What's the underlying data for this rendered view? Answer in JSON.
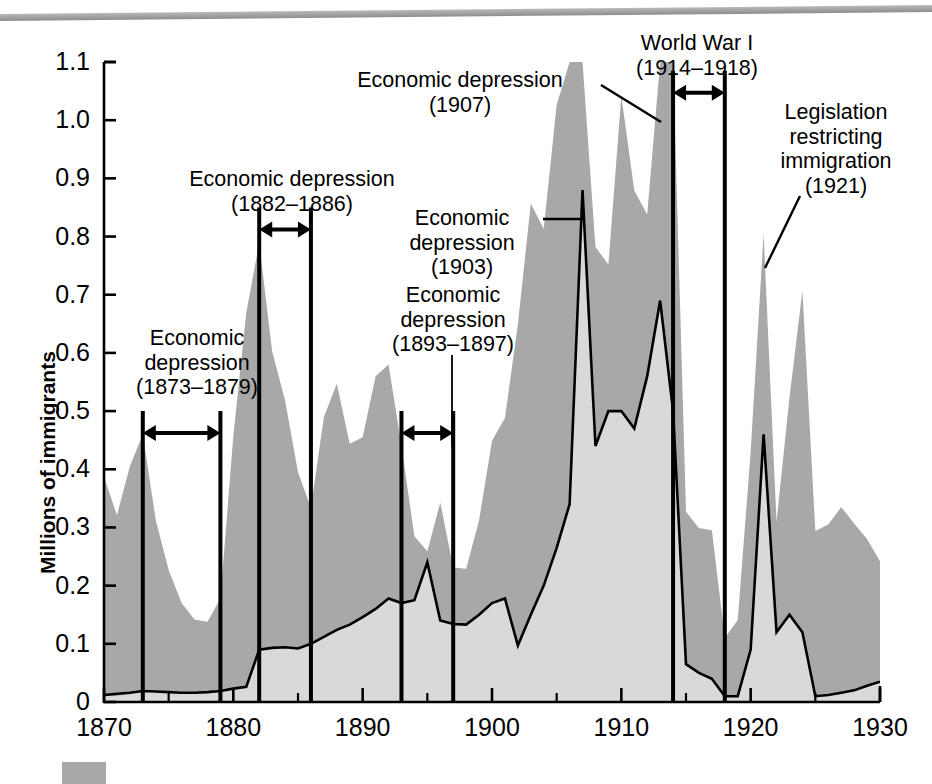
{
  "figure": {
    "top_rule": "decorative-gray-rule",
    "legend_swatch_color": "#a8a8a8"
  },
  "axes": {
    "y_label": "Millions of immigrants",
    "y_ticks": [
      "0",
      "0.1",
      "0.2",
      "0.3",
      "0.4",
      "0.5",
      "0.6",
      "0.7",
      "0.8",
      "0.9",
      "1.0",
      "1.1"
    ],
    "x_ticks": [
      "1870",
      "1880",
      "1890",
      "1900",
      "1910",
      "1920",
      "1930"
    ],
    "x_minor_ticks": [
      "1875",
      "1885",
      "1895",
      "1905",
      "1915",
      "1925"
    ]
  },
  "annotations": [
    {
      "id": "depression-1873",
      "line1": "Economic",
      "line2": "depression",
      "line3": "(1873–1879)",
      "text": "Economic\ndepression\n(1873–1879)",
      "start_year": 1873,
      "end_year": 1879,
      "marker_top_value": 0.5
    },
    {
      "id": "depression-1882",
      "line1": "Economic depression",
      "line2": "(1882–1886)",
      "text": "Economic depression\n(1882–1886)",
      "start_year": 1882,
      "end_year": 1886,
      "marker_top_value": 0.85
    },
    {
      "id": "depression-1893",
      "line1": "Economic",
      "line2": "depression",
      "line3": "(1893–1897)",
      "text": "Economic\ndepression\n(1893–1897)",
      "start_year": 1893,
      "end_year": 1897,
      "marker_top_value": 0.5
    },
    {
      "id": "depression-1903",
      "line1": "Economic",
      "line2": "depression",
      "line3": "(1903)",
      "text": "Economic\ndepression\n(1903)",
      "year": 1903,
      "leader": true
    },
    {
      "id": "depression-1907",
      "line1": "Economic depression",
      "line2": "(1907)",
      "text": "Economic depression\n(1907)",
      "year": 1907,
      "leader": true
    },
    {
      "id": "world-war-i",
      "line1": "World War I",
      "line2": "(1914–1918)",
      "text": "World War I\n(1914–1918)",
      "start_year": 1914,
      "end_year": 1918,
      "marker_top_value": 1.085
    },
    {
      "id": "legislation-1921",
      "line1": "Legislation",
      "line2": "restricting",
      "line3": "immigration",
      "line4": "(1921)",
      "text": "Legislation\nrestricting\nimmigration\n(1921)",
      "year": 1921,
      "leader": true
    }
  ],
  "chart_data": {
    "type": "area",
    "title": "",
    "xlabel": "",
    "ylabel": "Millions of immigrants",
    "xlim": [
      1870,
      1930
    ],
    "ylim": [
      0,
      1.1
    ],
    "grid": false,
    "legend_position": "below-axis",
    "x": [
      1870,
      1871,
      1872,
      1873,
      1874,
      1875,
      1876,
      1877,
      1878,
      1879,
      1880,
      1881,
      1882,
      1883,
      1884,
      1885,
      1886,
      1887,
      1888,
      1889,
      1890,
      1891,
      1892,
      1893,
      1894,
      1895,
      1896,
      1897,
      1898,
      1899,
      1900,
      1901,
      1902,
      1903,
      1904,
      1905,
      1906,
      1907,
      1908,
      1909,
      1910,
      1911,
      1912,
      1913,
      1914,
      1915,
      1916,
      1917,
      1918,
      1919,
      1920,
      1921,
      1922,
      1923,
      1924,
      1925,
      1926,
      1927,
      1928,
      1929,
      1930
    ],
    "series": [
      {
        "name": "Total immigration",
        "fill": "#a8a8a8",
        "values": [
          0.387,
          0.321,
          0.405,
          0.46,
          0.313,
          0.227,
          0.17,
          0.142,
          0.138,
          0.178,
          0.457,
          0.669,
          0.789,
          0.603,
          0.518,
          0.395,
          0.334,
          0.49,
          0.547,
          0.444,
          0.455,
          0.56,
          0.58,
          0.44,
          0.285,
          0.259,
          0.343,
          0.231,
          0.229,
          0.312,
          0.449,
          0.488,
          0.649,
          0.857,
          0.813,
          1.026,
          1.101,
          1.285,
          0.782,
          0.752,
          1.042,
          0.879,
          0.838,
          1.198,
          1.218,
          0.327,
          0.299,
          0.295,
          0.11,
          0.141,
          0.43,
          0.805,
          0.31,
          0.523,
          0.707,
          0.294,
          0.305,
          0.335,
          0.307,
          0.28,
          0.242
        ]
      },
      {
        "name": "Immigration from southern and eastern Europe",
        "fill": "#d9d9d9",
        "line": "#000000",
        "values": [
          0.012,
          0.014,
          0.016,
          0.019,
          0.018,
          0.017,
          0.016,
          0.016,
          0.017,
          0.019,
          0.023,
          0.026,
          0.09,
          0.093,
          0.094,
          0.092,
          0.1,
          0.112,
          0.124,
          0.133,
          0.146,
          0.16,
          0.178,
          0.17,
          0.175,
          0.24,
          0.14,
          0.134,
          0.133,
          0.15,
          0.17,
          0.178,
          0.097,
          0.15,
          0.2,
          0.265,
          0.34,
          0.88,
          0.44,
          0.5,
          0.5,
          0.47,
          0.56,
          0.69,
          0.5,
          0.065,
          0.05,
          0.04,
          0.01,
          0.01,
          0.09,
          0.46,
          0.12,
          0.15,
          0.12,
          0.01,
          0.012,
          0.016,
          0.02,
          0.028,
          0.035
        ]
      }
    ]
  }
}
